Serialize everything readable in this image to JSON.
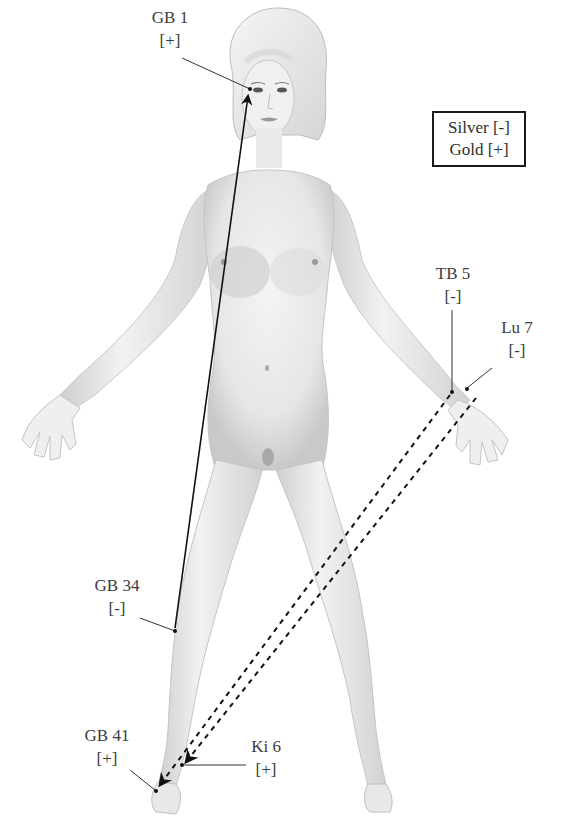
{
  "legend": {
    "silver": "Silver [-]",
    "gold": "Gold [+]"
  },
  "points": [
    {
      "id": "gb1",
      "name": "GB 1",
      "polarity": "[+]"
    },
    {
      "id": "tb5",
      "name": "TB 5",
      "polarity": "[-]"
    },
    {
      "id": "lu7",
      "name": "Lu 7",
      "polarity": "[-]"
    },
    {
      "id": "gb34",
      "name": "GB 34",
      "polarity": "[-]"
    },
    {
      "id": "gb41",
      "name": "GB 41",
      "polarity": "[+]"
    },
    {
      "id": "ki6",
      "name": "Ki 6",
      "polarity": "[+]"
    }
  ],
  "connections": [
    {
      "from": "GB 34",
      "to": "GB 1",
      "style": "solid"
    },
    {
      "from": "TB 5",
      "to": "GB 41",
      "style": "dashed"
    },
    {
      "from": "Lu 7",
      "to": "Ki 6",
      "style": "dashed"
    }
  ],
  "colors": {
    "line": "#111111",
    "skin": "#ececec",
    "shade": "#bdbdbd",
    "text": "#3c3c3c"
  }
}
